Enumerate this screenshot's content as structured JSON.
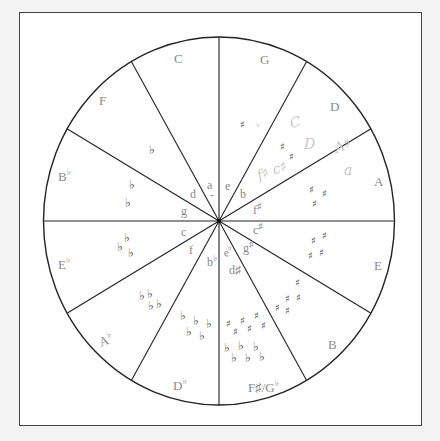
{
  "diagram": {
    "type": "circle-of-fifths",
    "colors": {
      "background": "#f3f3f3",
      "frame_fill": "#ffffff",
      "frame_border": "#444444",
      "lines": "#222222",
      "label_text": "#8a8a8a",
      "accidental_text": "#444444",
      "handwriting": "#c8c8c8"
    },
    "sectors": [
      {
        "major": "C",
        "major_sup": "",
        "minor": "a",
        "minor_sup": "",
        "accidentals": "",
        "accidental_count": 0
      },
      {
        "major": "G",
        "major_sup": "",
        "minor": "e",
        "minor_sup": "",
        "accidentals": "sharp",
        "accidental_count": 1
      },
      {
        "major": "D",
        "major_sup": "",
        "minor": "b",
        "minor_sup": "",
        "accidentals": "sharp",
        "accidental_count": 2
      },
      {
        "major": "A",
        "major_sup": "",
        "minor": "f",
        "minor_sup": "♯",
        "accidentals": "sharp",
        "accidental_count": 3
      },
      {
        "major": "E",
        "major_sup": "",
        "minor": "c",
        "minor_sup": "♯",
        "accidentals": "sharp",
        "accidental_count": 4
      },
      {
        "major": "B",
        "major_sup": "",
        "minor": "g",
        "minor_sup": "♯",
        "accidentals": "sharp",
        "accidental_count": 5
      },
      {
        "major": "F♯/G",
        "major_sup": "♭",
        "minor": "d♯ / e",
        "minor_sup": "♭",
        "accidentals": "sharp+flat",
        "accidental_count": 6
      },
      {
        "major": "D",
        "major_sup": "♭",
        "minor": "b",
        "minor_sup": "♭",
        "accidentals": "flat",
        "accidental_count": 5
      },
      {
        "major": "A",
        "major_sup": "♭",
        "minor": "f",
        "minor_sup": "",
        "accidentals": "flat",
        "accidental_count": 4
      },
      {
        "major": "E",
        "major_sup": "♭",
        "minor": "c",
        "minor_sup": "",
        "accidentals": "flat",
        "accidental_count": 3
      },
      {
        "major": "B",
        "major_sup": "♭",
        "minor": "g",
        "minor_sup": "",
        "accidentals": "flat",
        "accidental_count": 2
      },
      {
        "major": "F",
        "major_sup": "",
        "minor": "d",
        "minor_sup": "",
        "accidentals": "flat",
        "accidental_count": 1
      }
    ],
    "labels": {
      "major": {
        "c": "C",
        "g": "G",
        "d": "D",
        "a": "A",
        "e": "E",
        "b": "B",
        "fsharp_gflat": "F♯/G",
        "fsharp_gflat_sup": "♭",
        "dflat": "D",
        "dflat_sup": "♭",
        "aflat": "A",
        "aflat_sup": "♭",
        "eflat": "E",
        "eflat_sup": "♭",
        "bflat": "B",
        "bflat_sup": "♭",
        "f": "F"
      },
      "minor": {
        "a": "a",
        "e": "e",
        "b": "b",
        "fsharp": "f",
        "fsharp_sup": "♯",
        "csharp": "c",
        "csharp_sup": "♯",
        "gsharp": "g",
        "gsharp_sup": "♯",
        "dsharp": "d♯",
        "eflat": "e",
        "eflat_sup": "♭",
        "bflat": "b",
        "bflat_sup": "♭",
        "f": "f",
        "c": "c",
        "g": "g",
        "d": "d"
      }
    },
    "symbols": {
      "sharp": "♯",
      "flat": "♭"
    },
    "handwritten_notes": {
      "note1": "C",
      "note2": "D",
      "note3": "f♯ c♯",
      "note4": "A♯",
      "note5": "a",
      "note6": "o"
    }
  }
}
